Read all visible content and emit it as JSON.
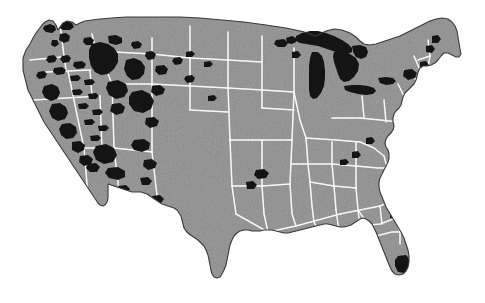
{
  "document": {
    "kind": "scanned-halftone-map",
    "title": "Map of the contiguous United States",
    "caption": "",
    "background_color": "#fefefe"
  },
  "map": {
    "region_name": "Contiguous United States",
    "projection_hint": "conic, curved northern border along the 49th parallel",
    "land_fill_color": "#8c8c8c",
    "land_texture": "halftone grain",
    "state_boundary_color": "#f2f2f2",
    "coastline_color": "#3a3a3a",
    "highlight_color": "#141414",
    "highlight_legend_label": "National forest and public land",
    "water_legend_label": "Great Lakes",
    "extent": {
      "left_px": 20,
      "top_px": 16,
      "right_px": 466,
      "bottom_px": 280
    },
    "features": [
      {
        "name": "great-lakes",
        "label": "Great Lakes",
        "type": "water"
      },
      {
        "name": "cascade-range",
        "label": "Cascade Range",
        "type": "public-land"
      },
      {
        "name": "northern-rockies",
        "label": "Northern Rockies",
        "type": "public-land"
      },
      {
        "name": "sierra-nevada",
        "label": "Sierra Nevada",
        "type": "public-land"
      },
      {
        "name": "colorado-rockies",
        "label": "Colorado Rockies",
        "type": "public-land"
      },
      {
        "name": "arizona-new-mexico-highlands",
        "label": "Arizona and New Mexico highlands",
        "type": "public-land"
      },
      {
        "name": "adirondacks-white-mountains",
        "label": "Adirondacks and White Mountains",
        "type": "public-land"
      },
      {
        "name": "everglades",
        "label": "Everglades",
        "type": "public-land"
      },
      {
        "name": "big-bend",
        "label": "Big Bend",
        "type": "public-land"
      },
      {
        "name": "ozarks",
        "label": "Ozarks",
        "type": "public-land"
      }
    ]
  }
}
